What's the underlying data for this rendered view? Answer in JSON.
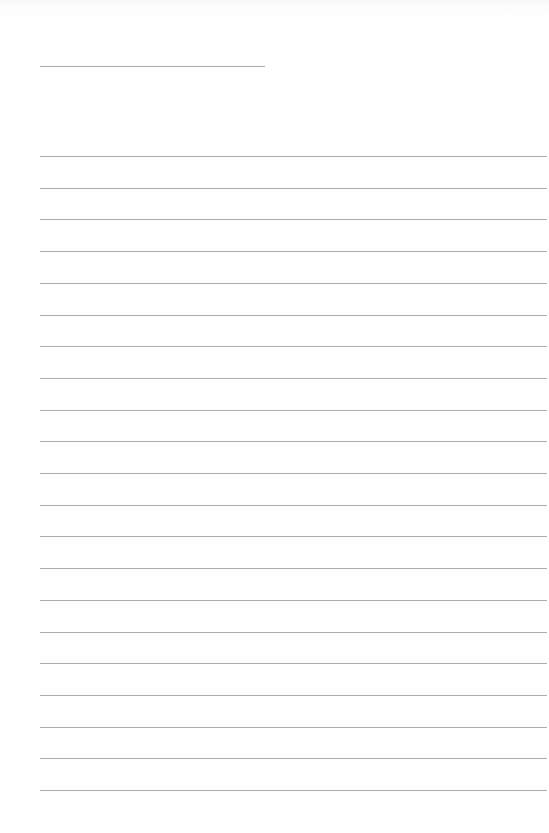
{
  "page": {
    "type": "blank lined paper",
    "background_color": "#fdfdfd",
    "line_color": "#adadad"
  },
  "header_line": {
    "x": 40,
    "y": 66,
    "width": 225
  },
  "ruled_lines": {
    "count": 21,
    "x": 40,
    "width": 507,
    "first_y": 156,
    "spacing": 31.7
  }
}
